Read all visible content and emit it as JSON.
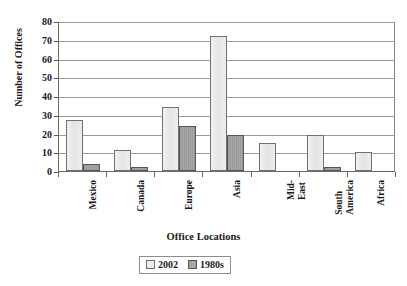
{
  "chart_data": {
    "type": "bar",
    "title": "",
    "xlabel": "Office Locations",
    "ylabel": "Number of Offices",
    "categories": [
      "Mexico",
      "Canada",
      "Europe",
      "Asia",
      "Mid-\nEast",
      "South\nAmerica",
      "Africa"
    ],
    "ylim": [
      0,
      80
    ],
    "yticks": [
      0,
      10,
      20,
      30,
      40,
      50,
      60,
      70,
      80
    ],
    "grid": true,
    "legend_position": "bottom-center",
    "series": [
      {
        "name": "2002",
        "values": [
          27,
          11,
          34,
          72,
          15,
          19,
          10
        ]
      },
      {
        "name": "1980s",
        "values": [
          4,
          2,
          24,
          19,
          0,
          2,
          0
        ]
      }
    ],
    "colors": {
      "2002": "#ededed",
      "1980s": "#9b9b9b",
      "axis": "#6a6a6a",
      "gridline": "#9a9a9a",
      "text": "#1a1a1a"
    }
  },
  "legend": {
    "items": [
      {
        "label": "2002"
      },
      {
        "label": "1980s"
      }
    ]
  }
}
